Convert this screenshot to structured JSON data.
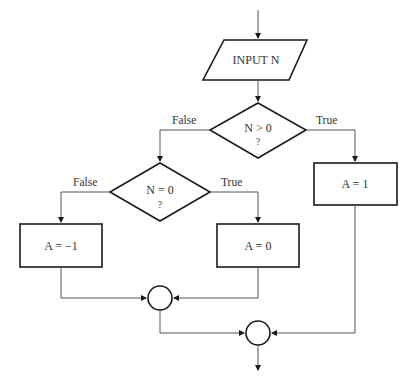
{
  "diagram": {
    "type": "flowchart",
    "nodes": {
      "input": {
        "shape": "parallelogram",
        "label": "INPUT N"
      },
      "decision1": {
        "shape": "diamond",
        "label": "N > 0",
        "sub": "?"
      },
      "decision2": {
        "shape": "diamond",
        "label": "N = 0",
        "sub": "?"
      },
      "assign_neg": {
        "shape": "rectangle",
        "label": "A = −1"
      },
      "assign_zero": {
        "shape": "rectangle",
        "label": "A = 0"
      },
      "assign_pos": {
        "shape": "rectangle",
        "label": "A = 1"
      },
      "join1": {
        "shape": "circle",
        "label": ""
      },
      "join2": {
        "shape": "circle",
        "label": ""
      }
    },
    "edge_labels": {
      "d1_false": "False",
      "d1_true": "True",
      "d2_false": "False",
      "d2_true": "True"
    },
    "edges": [
      {
        "from": "start",
        "to": "input"
      },
      {
        "from": "input",
        "to": "decision1"
      },
      {
        "from": "decision1",
        "to": "decision2",
        "label": "False"
      },
      {
        "from": "decision1",
        "to": "assign_pos",
        "label": "True"
      },
      {
        "from": "decision2",
        "to": "assign_neg",
        "label": "False"
      },
      {
        "from": "decision2",
        "to": "assign_zero",
        "label": "True"
      },
      {
        "from": "assign_neg",
        "to": "join1"
      },
      {
        "from": "assign_zero",
        "to": "join1"
      },
      {
        "from": "join1",
        "to": "join2"
      },
      {
        "from": "assign_pos",
        "to": "join2"
      },
      {
        "from": "join2",
        "to": "end"
      }
    ]
  }
}
